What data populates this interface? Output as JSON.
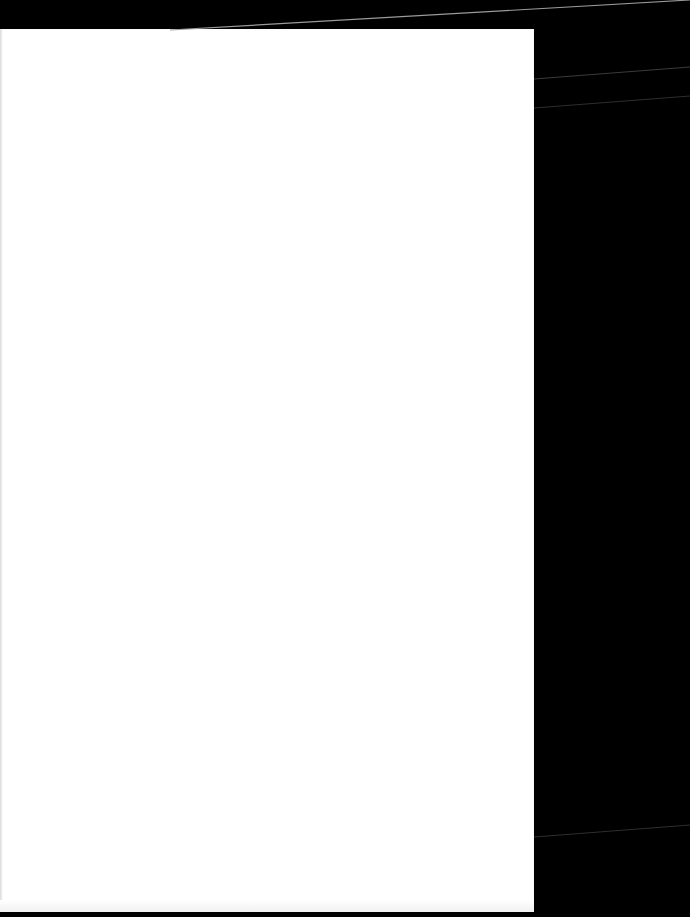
{
  "canvas": {
    "width": 690,
    "height": 917,
    "background_color": "#000000"
  },
  "sheet": {
    "description": "blank white page",
    "color": "#ffffff",
    "text": ""
  },
  "lines": {
    "color_top": "#9a9a9a",
    "color_faint": "#3a3a3a"
  }
}
